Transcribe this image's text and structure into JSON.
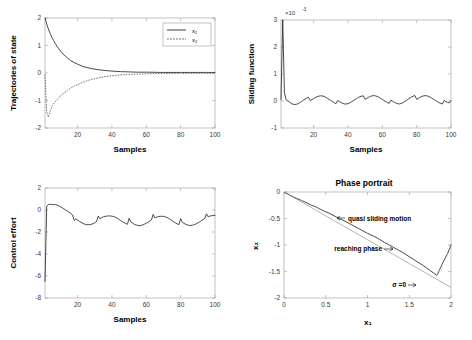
{
  "figure": {
    "background": "#ffffff",
    "line_color": "#2b2b2b",
    "axis_color": "#9a9a9a"
  },
  "chart_data": [
    {
      "id": "states",
      "type": "line",
      "title": "",
      "xlabel": "Samples",
      "ylabel": "Trajectories of state",
      "xlim": [
        1,
        100
      ],
      "ylim": [
        -2,
        2
      ],
      "xticks": [
        20,
        40,
        60,
        80,
        100
      ],
      "yticks": [
        -2,
        -1,
        0,
        1,
        2
      ],
      "ytick_labels": [
        "-2",
        "-1",
        "0",
        "1",
        "2"
      ],
      "grid": false,
      "legend_position": "upper-right",
      "legend": [
        "x₁",
        "x₂"
      ],
      "series": [
        {
          "name": "x₁",
          "style": "solid",
          "x": [
            1,
            2,
            3,
            4,
            5,
            6,
            7,
            8,
            9,
            10,
            12,
            14,
            16,
            18,
            20,
            23,
            26,
            29,
            32,
            36,
            40,
            45,
            50,
            55,
            60,
            65,
            70,
            75,
            80,
            85,
            90,
            95,
            100
          ],
          "values": [
            2.0,
            1.78,
            1.6,
            1.44,
            1.3,
            1.18,
            1.07,
            0.97,
            0.88,
            0.8,
            0.66,
            0.55,
            0.45,
            0.38,
            0.32,
            0.24,
            0.19,
            0.15,
            0.12,
            0.09,
            0.07,
            0.05,
            0.04,
            0.03,
            0.03,
            0.025,
            0.02,
            0.02,
            0.02,
            0.02,
            0.02,
            0.02,
            0.02
          ]
        },
        {
          "name": "x₂",
          "style": "dashed",
          "x": [
            1,
            2,
            3,
            4,
            5,
            6,
            7,
            8,
            9,
            10,
            12,
            14,
            16,
            18,
            20,
            23,
            26,
            29,
            32,
            36,
            40,
            45,
            50,
            55,
            60,
            65,
            70,
            75,
            80,
            85,
            90,
            95,
            100
          ],
          "values": [
            -0.05,
            -1.42,
            -1.6,
            -1.38,
            -1.22,
            -1.12,
            -1.04,
            -0.97,
            -0.9,
            -0.84,
            -0.73,
            -0.63,
            -0.55,
            -0.48,
            -0.42,
            -0.34,
            -0.27,
            -0.22,
            -0.18,
            -0.13,
            -0.1,
            -0.07,
            -0.05,
            -0.04,
            -0.03,
            -0.02,
            -0.02,
            -0.015,
            -0.015,
            -0.01,
            -0.01,
            -0.01,
            -0.01
          ]
        }
      ]
    },
    {
      "id": "sliding",
      "type": "line",
      "title": "",
      "xlabel": "Samples",
      "ylabel": "Sliding function",
      "y_exponent": "×10",
      "y_exponent_power": "-3",
      "xlim": [
        1,
        100
      ],
      "ylim": [
        -1,
        3
      ],
      "xticks": [
        20,
        40,
        60,
        80,
        100
      ],
      "yticks": [
        -1,
        0,
        1,
        2,
        3
      ],
      "ytick_labels": [
        "-1",
        "0",
        "1",
        "2",
        "3"
      ],
      "grid": false,
      "series": [
        {
          "name": "sigma",
          "style": "solid",
          "x": [
            1,
            2,
            3,
            4,
            5,
            6,
            7,
            8,
            9,
            10,
            11,
            12,
            13,
            14,
            15,
            16,
            17,
            18,
            19,
            20,
            21,
            22,
            23,
            24,
            25,
            26,
            27,
            28,
            29,
            30,
            31,
            32,
            33,
            34,
            35,
            36,
            37,
            38,
            39,
            40,
            41,
            42,
            43,
            44,
            45,
            46,
            47,
            48,
            49,
            50,
            51,
            52,
            53,
            54,
            55,
            56,
            57,
            58,
            59,
            60,
            61,
            62,
            63,
            64,
            65,
            66,
            67,
            68,
            69,
            70,
            71,
            72,
            73,
            74,
            75,
            76,
            77,
            78,
            79,
            80,
            81,
            82,
            83,
            84,
            85,
            86,
            87,
            88,
            89,
            90,
            91,
            92,
            93,
            94,
            95,
            96,
            97,
            98,
            99,
            100
          ],
          "values": [
            0.05,
            3.0,
            0.3,
            0.04,
            0.0,
            -0.04,
            -0.09,
            -0.12,
            -0.13,
            -0.12,
            -0.1,
            -0.06,
            -0.02,
            0.03,
            0.07,
            0.11,
            0.14,
            0.02,
            0.05,
            0.09,
            0.13,
            0.16,
            0.18,
            0.19,
            0.19,
            0.17,
            0.14,
            0.1,
            0.06,
            0.02,
            -0.02,
            -0.06,
            -0.1,
            0.02,
            -0.02,
            -0.06,
            -0.09,
            -0.11,
            -0.11,
            -0.1,
            -0.07,
            -0.03,
            0.01,
            0.05,
            0.09,
            0.13,
            0.16,
            0.18,
            0.19,
            0.06,
            0.1,
            0.14,
            0.17,
            0.19,
            0.2,
            0.19,
            0.17,
            0.14,
            0.1,
            0.06,
            0.02,
            -0.02,
            -0.06,
            -0.09,
            0.03,
            -0.01,
            -0.05,
            -0.08,
            -0.1,
            -0.11,
            -0.09,
            -0.06,
            -0.02,
            0.02,
            0.07,
            0.11,
            0.15,
            0.18,
            0.2,
            0.06,
            0.1,
            0.14,
            0.17,
            0.19,
            0.2,
            0.19,
            0.17,
            0.14,
            0.1,
            0.06,
            0.02,
            -0.02,
            -0.06,
            -0.09,
            -0.11,
            0.02,
            -0.02,
            -0.05,
            -0.07,
            0.02
          ]
        }
      ]
    },
    {
      "id": "control",
      "type": "line",
      "title": "",
      "xlabel": "Samples",
      "ylabel": "Control effort",
      "xlim": [
        1,
        100
      ],
      "ylim": [
        -8,
        2
      ],
      "xticks": [
        20,
        40,
        60,
        80,
        100
      ],
      "yticks": [
        -8,
        -6,
        -4,
        -2,
        0,
        2
      ],
      "ytick_labels": [
        "-8",
        "-6",
        "-4",
        "-2",
        "0",
        "2"
      ],
      "grid": false,
      "series": [
        {
          "name": "u",
          "style": "solid",
          "x": [
            1,
            2,
            3,
            4,
            5,
            6,
            7,
            8,
            9,
            10,
            11,
            12,
            13,
            14,
            15,
            16,
            17,
            18,
            19,
            20,
            21,
            22,
            23,
            24,
            25,
            26,
            27,
            28,
            29,
            30,
            31,
            32,
            33,
            34,
            35,
            36,
            37,
            38,
            39,
            40,
            41,
            42,
            43,
            44,
            45,
            46,
            47,
            48,
            49,
            50,
            51,
            52,
            53,
            54,
            55,
            56,
            57,
            58,
            59,
            60,
            61,
            62,
            63,
            64,
            65,
            66,
            67,
            68,
            69,
            70,
            71,
            72,
            73,
            74,
            75,
            76,
            77,
            78,
            79,
            80,
            81,
            82,
            83,
            84,
            85,
            86,
            87,
            88,
            89,
            90,
            91,
            92,
            93,
            94,
            95,
            96,
            97,
            98,
            99,
            100
          ],
          "values": [
            -6.5,
            0.35,
            0.5,
            0.52,
            0.5,
            0.48,
            0.5,
            0.45,
            0.38,
            0.3,
            0.2,
            0.1,
            0.0,
            -0.1,
            -0.2,
            -0.32,
            -0.45,
            -0.95,
            -0.8,
            -0.92,
            -1.02,
            -1.12,
            -1.2,
            -1.28,
            -1.32,
            -1.34,
            -1.33,
            -1.3,
            -1.24,
            -1.16,
            -1.05,
            -0.55,
            -0.8,
            -0.7,
            -0.62,
            -0.58,
            -0.55,
            -0.54,
            -0.54,
            -0.56,
            -0.6,
            -0.66,
            -0.74,
            -0.84,
            -0.95,
            -1.05,
            -1.15,
            -1.22,
            -1.3,
            -0.75,
            -1.1,
            -1.2,
            -1.3,
            -1.36,
            -1.4,
            -1.42,
            -1.4,
            -1.35,
            -1.28,
            -1.2,
            -1.12,
            -1.0,
            -0.9,
            -0.4,
            -0.72,
            -0.65,
            -0.6,
            -0.58,
            -0.57,
            -0.58,
            -0.62,
            -0.68,
            -0.76,
            -0.86,
            -0.97,
            -1.08,
            -1.18,
            -1.26,
            -1.33,
            -0.78,
            -1.12,
            -1.22,
            -1.3,
            -1.36,
            -1.4,
            -1.4,
            -1.38,
            -1.33,
            -1.26,
            -1.18,
            -1.08,
            -0.98,
            -0.88,
            -0.78,
            -0.35,
            -0.62,
            -0.55,
            -0.52,
            -0.5,
            -0.48
          ]
        }
      ]
    },
    {
      "id": "phase",
      "type": "line",
      "title": "Phase portrait",
      "xlabel": "x₁",
      "ylabel": "x₂",
      "xlim": [
        0,
        2
      ],
      "ylim": [
        -2,
        0
      ],
      "xticks": [
        0,
        0.5,
        1,
        1.5,
        2
      ],
      "xtick_labels": [
        "0",
        "0.5",
        "1",
        "1.5",
        "2"
      ],
      "yticks": [
        -2,
        -1.5,
        -1,
        -0.5,
        0
      ],
      "ytick_labels": [
        "-2",
        "-1.5",
        "-1",
        "-0.5",
        "0"
      ],
      "grid": false,
      "annotations": [
        {
          "text": "quasi sliding motion",
          "arrow": "left"
        },
        {
          "text": "reaching phase",
          "arrow": "right"
        },
        {
          "text": "σ =0",
          "arrow": "right"
        }
      ],
      "series": [
        {
          "name": "trajectory",
          "style": "solid",
          "x": [
            2.0,
            1.96,
            1.9,
            1.86,
            1.84,
            1.83,
            1.8,
            1.74,
            1.66,
            1.58,
            1.5,
            1.42,
            1.34,
            1.26,
            1.2,
            1.13,
            1.07,
            1.0,
            0.93,
            0.86,
            0.8,
            0.73,
            0.66,
            0.6,
            0.54,
            0.48,
            0.43,
            0.38,
            0.33,
            0.29,
            0.25,
            0.21,
            0.18,
            0.15,
            0.12,
            0.1,
            0.08,
            0.06,
            0.05,
            0.04,
            0.03,
            0.02,
            0.015,
            0.01
          ],
          "values": [
            -1.0,
            -1.16,
            -1.34,
            -1.48,
            -1.55,
            -1.57,
            -1.54,
            -1.47,
            -1.38,
            -1.3,
            -1.22,
            -1.14,
            -1.07,
            -1.0,
            -0.95,
            -0.88,
            -0.83,
            -0.78,
            -0.72,
            -0.66,
            -0.61,
            -0.55,
            -0.5,
            -0.45,
            -0.4,
            -0.36,
            -0.32,
            -0.28,
            -0.25,
            -0.22,
            -0.19,
            -0.16,
            -0.14,
            -0.12,
            -0.1,
            -0.08,
            -0.07,
            -0.05,
            -0.04,
            -0.03,
            -0.03,
            -0.02,
            -0.02,
            -0.01
          ]
        },
        {
          "name": "sliding-surface",
          "style": "thin",
          "x": [
            0,
            2.0
          ],
          "values": [
            0.0,
            -1.8
          ]
        }
      ]
    }
  ]
}
